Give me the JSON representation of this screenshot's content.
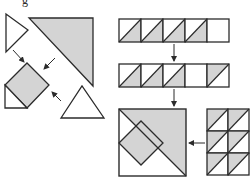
{
  "diagram": {
    "colors": {
      "stroke": "#2b2b2b",
      "fill_gray": "#d4d4d4",
      "fill_white": "#ffffff",
      "background": "#ffffff"
    },
    "left_assembly": {
      "description": "Center diamond with setting triangles being joined",
      "pieces": [
        {
          "name": "left-setting-triangle",
          "fill": "white",
          "points": "6,14 6,52 28,30"
        },
        {
          "name": "large-gray-triangle",
          "fill": "gray",
          "points": "29,18 93,18 93,86"
        },
        {
          "name": "center-diamond",
          "fill": "gray",
          "points": "27,63 49,85 27,108 5,85"
        },
        {
          "name": "corner-triangle",
          "fill": "white",
          "points": "5,85 5,108 27,108"
        },
        {
          "name": "bottom-setting-triangle",
          "fill": "white",
          "points": "61,118 82,86 104,118"
        }
      ],
      "arrows": [
        {
          "name": "arrow-to-diamond-nw",
          "x1": 13,
          "y1": 50,
          "x2": 24,
          "y2": 62
        },
        {
          "name": "arrow-to-diamond-ne",
          "x1": 55,
          "y1": 58,
          "x2": 44,
          "y2": 69
        },
        {
          "name": "arrow-to-diamond-se",
          "x1": 61,
          "y1": 101,
          "x2": 52,
          "y2": 92
        }
      ]
    },
    "strip_1": {
      "x": 119,
      "y": 19,
      "cell_w": 22,
      "cell_h": 23,
      "cells": [
        "hst-lower-right",
        "hst-lower-right",
        "hst-lower-right",
        "hst-lower-right",
        "blank"
      ]
    },
    "strip_2": {
      "x": 119,
      "y": 64,
      "cell_w": 22,
      "cell_h": 23,
      "cells": [
        "hst-lower-right",
        "hst-lower-right",
        "hst-lower-right",
        "blank",
        "hst-upper-left"
      ]
    },
    "arrows_down": [
      {
        "name": "arrow-strip1-to-strip2",
        "x1": 174,
        "y1": 44,
        "x2": 174,
        "y2": 61
      },
      {
        "name": "arrow-strip2-to-block",
        "x1": 174,
        "y1": 89,
        "x2": 174,
        "y2": 106
      }
    ],
    "finished_block": {
      "x": 119,
      "y": 109,
      "size": 67,
      "gray_triangle": "119,109 186,109 186,176",
      "diamond": "119,143 141,121 163,143 141,165",
      "diamond_fill": "gray"
    },
    "arrow_left": {
      "name": "arrow-grid-to-block",
      "x1": 205,
      "y1": 143,
      "x2": 189,
      "y2": 143
    },
    "grid": {
      "x": 207,
      "y": 109,
      "cols": 2,
      "rows": 3,
      "cell_w": 21,
      "cell_h": 22,
      "cell_style": "hst-upper-left"
    },
    "cropped_text_fragment": "g"
  }
}
